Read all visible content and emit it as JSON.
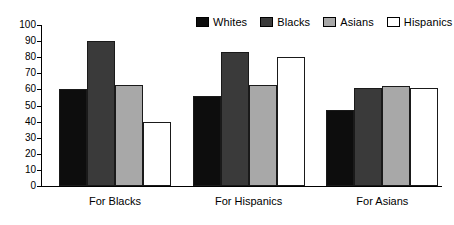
{
  "chart_data": {
    "type": "bar",
    "title": "",
    "xlabel": "",
    "ylabel": "",
    "ylim": [
      0,
      100
    ],
    "ytick_step": 10,
    "yticks": [
      0,
      10,
      20,
      30,
      40,
      50,
      60,
      70,
      80,
      90,
      100
    ],
    "grid": false,
    "legend_position": "top-right",
    "categories": [
      "For Blacks",
      "For Hispanics",
      "For Asians"
    ],
    "series": [
      {
        "name": "Whites",
        "color": "#0d0d0d",
        "values": [
          60,
          56,
          47
        ]
      },
      {
        "name": "Blacks",
        "color": "#3a3a3a",
        "values": [
          90,
          83,
          61
        ]
      },
      {
        "name": "Asians",
        "color": "#a8a8a8",
        "values": [
          63,
          63,
          62
        ]
      },
      {
        "name": "Hispanics",
        "color": "#ffffff",
        "values": [
          40,
          80,
          61
        ]
      }
    ]
  }
}
